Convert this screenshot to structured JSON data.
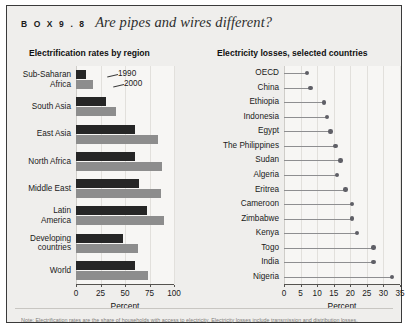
{
  "box": {
    "kicker": "B O X   9 . 8",
    "title": "Are pipes and wires different?",
    "footnote": "Note: Electrification rates are the share of households with access to electricity. Electricity losses include transmission and distribution losses."
  },
  "colors": {
    "bar_1990": "#262626",
    "bar_2000": "#8d8d8d",
    "dot": "#5f5f66",
    "stem": "#8e8e90",
    "panel_bg": "#efeeec",
    "plot_bg": "#f7f6f4",
    "frame": "#3a3a3a"
  },
  "left_panel": {
    "title": "Electrification rates by region",
    "legend": [
      {
        "label": "1990",
        "series": "y1990"
      },
      {
        "label": "2000",
        "series": "y2000"
      }
    ]
  },
  "right_panel": {
    "title": "Electricity losses, selected countries"
  },
  "chart_data": [
    {
      "type": "bar",
      "title": "Electrification rates by region",
      "xlabel": "Percent",
      "ylabel": "",
      "xlim": [
        0,
        100
      ],
      "ticks": [
        0,
        25,
        50,
        75,
        100
      ],
      "grid": true,
      "orientation": "horizontal",
      "legend_position": "inside-top-left",
      "categories": [
        "Sub-Saharan Africa",
        "South Asia",
        "East Asia",
        "North Africa",
        "Middle East",
        "Latin America",
        "Developing countries",
        "World"
      ],
      "category_lines": [
        [
          "Sub-Saharan",
          "Africa"
        ],
        [
          "South Asia"
        ],
        [
          "East Asia"
        ],
        [
          "North Africa"
        ],
        [
          "Middle East"
        ],
        [
          "Latin",
          "America"
        ],
        [
          "Developing",
          "countries"
        ],
        [
          "World"
        ]
      ],
      "series": [
        {
          "name": "1990",
          "values": [
            10,
            31,
            60,
            60,
            64,
            72,
            48,
            60
          ]
        },
        {
          "name": "2000",
          "values": [
            17,
            41,
            84,
            88,
            87,
            90,
            63,
            73
          ]
        }
      ]
    },
    {
      "type": "scatter",
      "subtype": "lollipop",
      "title": "Electricity losses, selected countries",
      "xlabel": "Percent",
      "ylabel": "",
      "xlim": [
        0,
        35
      ],
      "ticks": [
        0,
        5,
        10,
        15,
        20,
        25,
        30,
        35
      ],
      "grid": true,
      "orientation": "horizontal",
      "categories": [
        "OECD",
        "China",
        "Ethiopia",
        "Indonesia",
        "Egypt",
        "The Philippines",
        "Sudan",
        "Algeria",
        "Eritrea",
        "Cameroon",
        "Zimbabwe",
        "Kenya",
        "Togo",
        "India",
        "Nigeria"
      ],
      "values": [
        7,
        8,
        12,
        13,
        14,
        15.5,
        17,
        16,
        18.5,
        20.5,
        20.5,
        22,
        27,
        27,
        32.5
      ]
    }
  ]
}
